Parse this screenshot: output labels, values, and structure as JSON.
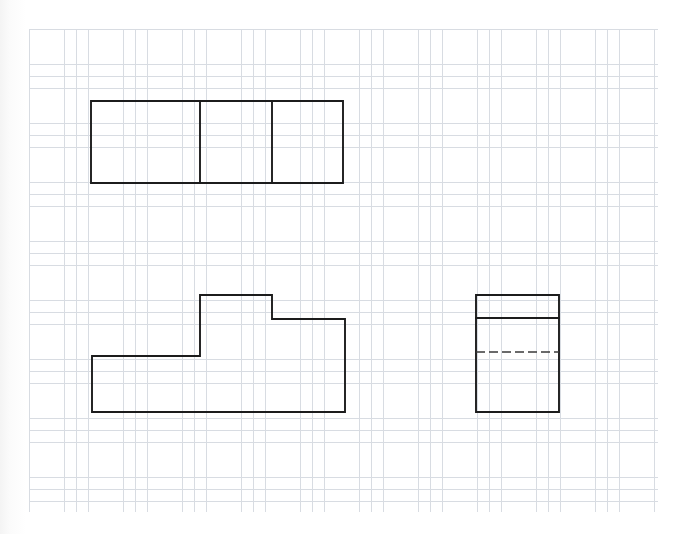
{
  "document": {
    "title": "Orthographic Projection Sketch",
    "medium": "graph paper",
    "paper_color": "#ffffff",
    "width": 687,
    "height": 534
  },
  "grid": {
    "name": "graph-paper-grid",
    "origin_x": 29,
    "origin_y": 29,
    "width": 629,
    "height": 483,
    "minor_pitch": 11.8,
    "minor_color": "#d8dce2",
    "major_every": 1,
    "major_color": "#c3c8d0",
    "line_width": 0.6
  },
  "chart_data": {
    "type": "line",
    "xlabel": "",
    "ylabel": "",
    "grid": true,
    "legend_position": "none",
    "views": [
      {
        "name": "top-view",
        "label": "Top view",
        "description": "Rectangle divided into three panels by two vertical lines",
        "bounds": {
          "x": 91,
          "y": 101,
          "width": 252,
          "height": 82
        },
        "outline": [
          [
            91,
            101
          ],
          [
            343,
            101
          ],
          [
            343,
            183
          ],
          [
            91,
            183
          ],
          [
            91,
            101
          ]
        ],
        "internal_lines": [
          {
            "name": "divider-1",
            "style": "solid",
            "points": [
              [
                200,
                101
              ],
              [
                200,
                183
              ]
            ]
          },
          {
            "name": "divider-2",
            "style": "solid",
            "points": [
              [
                272,
                101
              ],
              [
                272,
                183
              ]
            ]
          }
        ]
      },
      {
        "name": "front-view",
        "label": "Front view",
        "description": "Stepped L-shaped profile with raised central block",
        "bounds": {
          "x": 92,
          "y": 295,
          "width": 253,
          "height": 117
        },
        "outline": [
          [
            92,
            356
          ],
          [
            200,
            356
          ],
          [
            200,
            295
          ],
          [
            272,
            295
          ],
          [
            272,
            319
          ],
          [
            345,
            319
          ],
          [
            345,
            412
          ],
          [
            92,
            412
          ],
          [
            92,
            356
          ]
        ],
        "internal_lines": []
      },
      {
        "name": "side-view",
        "label": "Side view",
        "description": "Rectangle with a solid horizontal line near the top and a dashed hidden line below",
        "bounds": {
          "x": 476,
          "y": 295,
          "width": 83,
          "height": 117
        },
        "outline": [
          [
            476,
            295
          ],
          [
            559,
            295
          ],
          [
            559,
            412
          ],
          [
            476,
            412
          ],
          [
            476,
            295
          ]
        ],
        "internal_lines": [
          {
            "name": "solid-edge-line",
            "style": "solid",
            "points": [
              [
                476,
                318
              ],
              [
                559,
                318
              ]
            ]
          },
          {
            "name": "hidden-edge-line",
            "style": "dashed",
            "points": [
              [
                476,
                352
              ],
              [
                559,
                352
              ]
            ],
            "dash_pattern": "9 4"
          }
        ]
      }
    ],
    "line_styles": {
      "visible_edge": {
        "color": "#1c1c1c",
        "width": 1.9,
        "dash": "none"
      },
      "hidden_edge": {
        "color": "#3a3a3a",
        "width": 1.7,
        "dash": "9 4"
      }
    }
  }
}
